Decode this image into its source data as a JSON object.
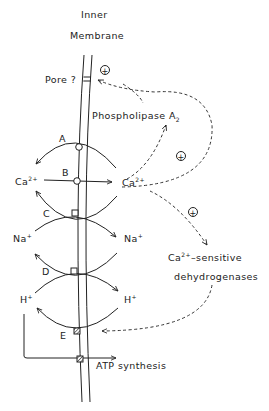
{
  "diagram": {
    "title_line1": "Inner",
    "title_line2": "Membrane",
    "pore_label": "Pore ?",
    "phospholipase_label": "Phospholipase A",
    "phospholipase_sub": "2",
    "transporters": [
      {
        "id": "A",
        "label": "A",
        "type": "circle"
      },
      {
        "id": "B",
        "label": "B",
        "type": "circle"
      },
      {
        "id": "C",
        "label": "C",
        "type": "square"
      },
      {
        "id": "D",
        "label": "D",
        "type": "square"
      },
      {
        "id": "E",
        "label": "E",
        "type": "hatched"
      }
    ],
    "ions": {
      "ca_left": "Ca",
      "ca_left_sup": "2+",
      "ca_right": "Ca",
      "ca_right_sup": "2+",
      "na_left": "Na",
      "na_left_sup": "+",
      "na_right": "Na",
      "na_right_sup": "+",
      "h_left": "H",
      "h_left_sup": "+",
      "h_right": "H",
      "h_right_sup": "+"
    },
    "dehydrogenase_line1_prefix": "Ca",
    "dehydrogenase_line1_sup": "2+",
    "dehydrogenase_line1_suffix": "–sensitive",
    "dehydrogenase_line2": "dehydrogenases",
    "atp_label": "ATP synthesis",
    "activation_symbol": "+",
    "colors": {
      "ink": "#222222",
      "background": "#ffffff"
    }
  }
}
